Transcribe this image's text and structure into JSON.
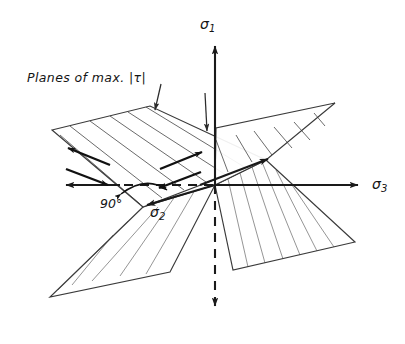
{
  "figure": {
    "background_color": "#ffffff",
    "ink_color": "#1a1a1a",
    "hatch_color": "#8f8f8f",
    "width": 405,
    "height": 344
  },
  "labels": {
    "planes_annotation": "Planes of max. |τ|",
    "sigma1": "σ",
    "sigma1_sub": "1",
    "sigma2": "σ",
    "sigma2_sub": "2",
    "sigma3": "σ",
    "sigma3_sub": "3",
    "angle": "90°"
  },
  "axes": [
    {
      "name": "sigma-1-axis",
      "label": "σ1",
      "direction": "vertical",
      "solid_from": [
        215,
        185
      ],
      "solid_to": [
        215,
        42
      ],
      "arrow_head": "up",
      "dashed_from": [
        215,
        185
      ],
      "dashed_to": [
        215,
        312
      ],
      "dashed_arrow_head": "down"
    },
    {
      "name": "sigma-3-axis",
      "label": "σ3",
      "direction": "horizontal-right",
      "solid_from": [
        215,
        185
      ],
      "solid_to": [
        364,
        185
      ],
      "arrow_head": "right",
      "dashed_from": [
        215,
        185
      ],
      "dashed_to": [
        118,
        185
      ],
      "negative_solid_from": [
        118,
        185
      ],
      "negative_solid_to": [
        62,
        185
      ],
      "negative_arrow_head": "left"
    },
    {
      "name": "sigma-2-axis",
      "label": "σ2",
      "direction": "diagonal",
      "solid_from": [
        266,
        160
      ],
      "solid_to": [
        143,
        207
      ],
      "arrow_head_near": "down-left",
      "arrow_head_far": "up-right"
    }
  ],
  "planes": [
    {
      "name": "plane-upper-left",
      "description": "Upper-left inclined plane of maximum shear",
      "corners": [
        [
          52,
          130
        ],
        [
          150,
          106
        ],
        [
          266,
          160
        ],
        [
          143,
          207
        ]
      ],
      "hatch_count": 6
    },
    {
      "name": "plane-upper-right",
      "description": "Upper-right inclined plane of maximum shear",
      "corners": [
        [
          215,
          185
        ],
        [
          216,
          128
        ],
        [
          335,
          103
        ],
        [
          266,
          160
        ]
      ],
      "hatch_count": 6
    },
    {
      "name": "plane-lower-left",
      "description": "Lower-left inclined plane of maximum shear",
      "corners": [
        [
          143,
          207
        ],
        [
          50,
          297
        ],
        [
          170,
          272
        ],
        [
          215,
          185
        ]
      ],
      "hatch_count": 5
    },
    {
      "name": "plane-lower-right",
      "description": "Lower-right inclined plane of maximum shear",
      "corners": [
        [
          215,
          185
        ],
        [
          266,
          160
        ],
        [
          355,
          242
        ],
        [
          233,
          270
        ]
      ],
      "hatch_count": 6
    }
  ],
  "shear_couples": [
    {
      "name": "shear-couple-left",
      "arrow_a": {
        "from": [
          108,
          164
        ],
        "to": [
          66,
          147
        ]
      },
      "arrow_b": {
        "from": [
          68,
          167
        ],
        "to": [
          110,
          183
        ]
      }
    },
    {
      "name": "shear-couple-right",
      "arrow_a": {
        "from": [
          161,
          168
        ],
        "to": [
          203,
          152
        ]
      },
      "arrow_b": {
        "from": [
          200,
          171
        ],
        "to": [
          159,
          186
        ]
      }
    }
  ],
  "leaders": [
    {
      "name": "leader-to-plane-edge",
      "from": [
        160,
        83
      ],
      "to": [
        155,
        112
      ],
      "arrow_head": "down"
    },
    {
      "name": "leader-to-plane-inner",
      "from": [
        205,
        92
      ],
      "to": [
        207,
        133
      ],
      "arrow_head": "down"
    }
  ],
  "angle_marker": {
    "name": "angle-90-arc",
    "value": "90°",
    "vertex": [
      143,
      207
    ],
    "arc_from": [
      122,
      196
    ],
    "arc_to": [
      168,
      191
    ]
  }
}
